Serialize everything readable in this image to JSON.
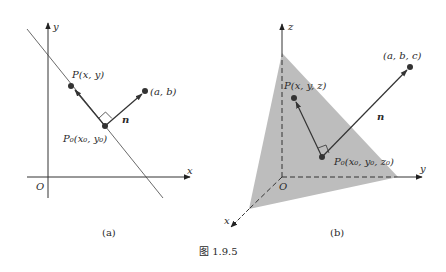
{
  "figure": {
    "caption": "图 1.9.5",
    "panel_a": {
      "label": "(a)",
      "axis_x_label": "x",
      "axis_y_label": "y",
      "origin_label": "O",
      "point_p_label": "P(x, y)",
      "point_p0_label": "P₀(x₀, y₀)",
      "point_normal_end_label": "(a, b)",
      "normal_vector_label": "n"
    },
    "panel_b": {
      "label": "(b)",
      "axis_x_label": "x",
      "axis_y_label": "y",
      "axis_z_label": "z",
      "origin_label": "O",
      "point_p_label": "P(x, y, z)",
      "point_p0_label": "P₀(x₀, y₀, z₀)",
      "point_normal_end_label": "(a, b, c)",
      "normal_vector_label": "n",
      "plane_color": "#bdbdbd"
    }
  }
}
